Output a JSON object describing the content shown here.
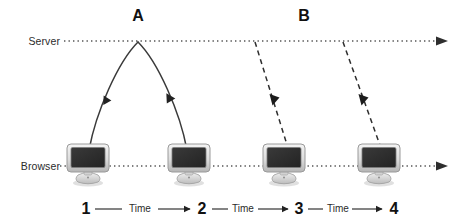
{
  "diagram": {
    "axes": [
      {
        "id": "server",
        "label": "Server",
        "y": 41,
        "style": "dotted",
        "arrow": "right"
      },
      {
        "id": "browser",
        "label": "Browser",
        "y": 166,
        "style": "dotted",
        "arrow": "right"
      }
    ],
    "phases": [
      {
        "id": "a",
        "label": "A",
        "x": 138,
        "style": "solid-arc"
      },
      {
        "id": "b",
        "label": "B",
        "x": 304,
        "style": "dashed-lines"
      }
    ],
    "nodes": [
      {
        "id": "n1",
        "icon": "monitor-icon",
        "step": "1",
        "x": 65,
        "y": 143
      },
      {
        "id": "n2",
        "icon": "monitor-icon",
        "step": "2",
        "x": 166,
        "y": 143
      },
      {
        "id": "n3",
        "icon": "monitor-icon",
        "step": "3",
        "x": 261,
        "y": 143
      },
      {
        "id": "n4",
        "icon": "monitor-icon",
        "step": "4",
        "x": 356,
        "y": 143
      }
    ],
    "timeline": {
      "steps": [
        "1",
        "2",
        "3",
        "4"
      ],
      "segment_label": "Time",
      "segments": [
        {
          "from": "1",
          "to": "2",
          "label": "Time"
        },
        {
          "from": "2",
          "to": "3",
          "label": "Time"
        },
        {
          "from": "3",
          "to": "4",
          "label": "Time"
        }
      ]
    },
    "flows": [
      {
        "id": "request-a",
        "style": "solid",
        "from": "browser",
        "to": "server",
        "arrow": "up-left"
      },
      {
        "id": "response-a",
        "style": "solid",
        "from": "server",
        "to": "browser",
        "arrow": "down-right"
      },
      {
        "id": "push-b1",
        "style": "dashed",
        "from": "server",
        "to": "n3",
        "arrow": "down"
      },
      {
        "id": "push-b2",
        "style": "dashed",
        "from": "server",
        "to": "n4",
        "arrow": "down"
      }
    ],
    "colors": {
      "line": "#3a3a3a",
      "text": "#111111",
      "label_text": "#2b2b2b",
      "screen": "#2e2e2e",
      "bezel_light": "#e8e8e8",
      "bezel_dark": "#b9b9b9",
      "background": "#ffffff"
    }
  }
}
